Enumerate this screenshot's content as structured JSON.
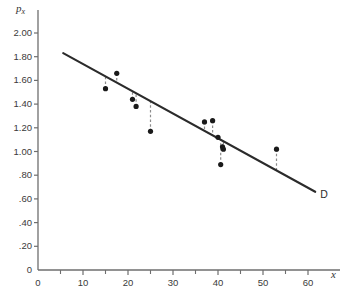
{
  "chart_data": {
    "type": "scatter",
    "title": "",
    "xlabel": "x",
    "ylabel": "p_x",
    "xlim": [
      0,
      62
    ],
    "ylim": [
      0,
      2.1
    ],
    "grid": false,
    "legend": "none",
    "x_ticks": [
      0,
      10,
      20,
      30,
      40,
      50,
      60
    ],
    "x_tick_labels": [
      "0",
      "10",
      "20",
      "30",
      "40",
      "50",
      "60"
    ],
    "x_minor_ticks": [
      5,
      15,
      25,
      35,
      45,
      55
    ],
    "y_ticks": [
      0,
      0.2,
      0.4,
      0.6,
      0.8,
      1.0,
      1.2,
      1.4,
      1.6,
      1.8,
      2.0
    ],
    "y_tick_labels": [
      "0",
      ".20",
      ".40",
      ".60",
      ".80",
      "1.00",
      "1.20",
      "1.40",
      "1.60",
      "1.80",
      "2.00"
    ],
    "points": [
      {
        "x": 15.0,
        "y": 1.53
      },
      {
        "x": 17.5,
        "y": 1.66
      },
      {
        "x": 21.0,
        "y": 1.44
      },
      {
        "x": 21.8,
        "y": 1.38
      },
      {
        "x": 25.0,
        "y": 1.17
      },
      {
        "x": 37.0,
        "y": 1.25
      },
      {
        "x": 38.8,
        "y": 1.26
      },
      {
        "x": 40.0,
        "y": 1.12
      },
      {
        "x": 41.0,
        "y": 1.04
      },
      {
        "x": 41.2,
        "y": 1.02
      },
      {
        "x": 40.6,
        "y": 0.89
      },
      {
        "x": 53.0,
        "y": 1.02
      }
    ],
    "fit_line": {
      "label": "D",
      "x_start": 5.6,
      "y_start": 1.83,
      "x_end": 61.6,
      "y_end": 0.66,
      "style": "solid"
    },
    "residual_style": "dashed-vertical",
    "marker": "filled-circle",
    "colors": {
      "marker": "#1a1a1a",
      "line": "#2b2b2b",
      "residual": "#8c8c8c",
      "axis": "#6e6e6e",
      "background": "#ffffff"
    }
  }
}
